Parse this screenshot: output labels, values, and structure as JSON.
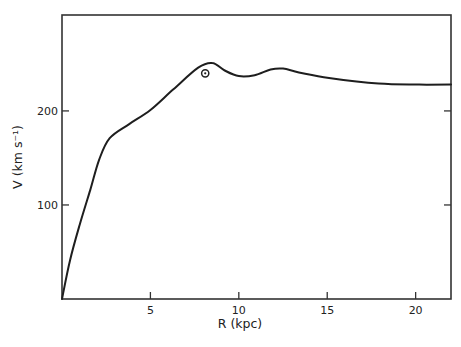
{
  "chart_data": {
    "type": "line",
    "title": "",
    "xlabel": "R (kpc)",
    "ylabel": "V (km s⁻¹)",
    "xlim": [
      0,
      22
    ],
    "ylim": [
      0,
      302
    ],
    "grid": false,
    "x_ticks": [
      5,
      10,
      15,
      20
    ],
    "x_tick_labels": [
      "5",
      "10",
      "15",
      "20"
    ],
    "y_ticks": [
      100,
      200
    ],
    "y_tick_labels": [
      "100",
      "200"
    ],
    "series": [
      {
        "name": "Galactic rotation curve",
        "x": [
          0,
          0.45,
          1.0,
          1.6,
          2.1,
          2.7,
          3.8,
          5.0,
          6.3,
          7.7,
          8.5,
          9.2,
          10.0,
          10.9,
          11.8,
          12.5,
          13.4,
          15.1,
          17.9,
          20.2,
          22.0
        ],
        "y": [
          0,
          41,
          79,
          116,
          148,
          171,
          186,
          201,
          223,
          246,
          251,
          243,
          237,
          238,
          244,
          245,
          241,
          235,
          229,
          228,
          228
        ]
      }
    ],
    "annotations": [
      {
        "type": "sun-symbol",
        "label": "⊙",
        "x": 8.1,
        "y": 240
      }
    ]
  },
  "axes": {
    "x_label": "R (kpc)",
    "y_label": "V (km s⁻¹)",
    "x_ticks": [
      "5",
      "10",
      "15",
      "20"
    ],
    "y_ticks": [
      "100",
      "200"
    ]
  }
}
